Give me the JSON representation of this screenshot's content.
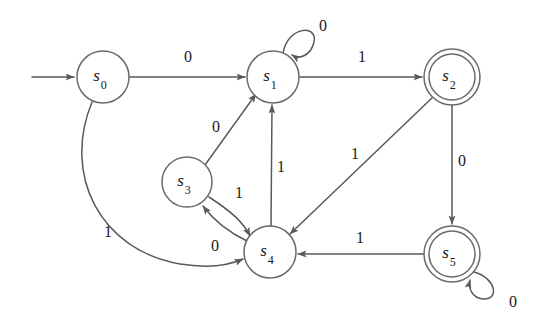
{
  "diagram": {
    "type": "state-machine",
    "background_color": "#ffffff",
    "stroke_color": "#595959",
    "node_stroke_color": "#6b6b6b",
    "text_color": "#1a1a1a",
    "alphabet": [
      "0",
      "1"
    ],
    "start_state": "s0",
    "accepting_states": [
      "s2",
      "s5"
    ]
  },
  "nodes": [
    {
      "id": "s0",
      "base": "s",
      "sub": "0",
      "cx": 103,
      "cy": 77,
      "r": 26,
      "accepting": false
    },
    {
      "id": "s1",
      "base": "s",
      "sub": "1",
      "cx": 273,
      "cy": 77,
      "r": 26,
      "accepting": false
    },
    {
      "id": "s2",
      "base": "s",
      "sub": "2",
      "cx": 452,
      "cy": 77,
      "r": 28,
      "accepting": true
    },
    {
      "id": "s3",
      "base": "s",
      "sub": "3",
      "cx": 187,
      "cy": 182,
      "r": 25,
      "accepting": false
    },
    {
      "id": "s4",
      "base": "s",
      "sub": "4",
      "cx": 270,
      "cy": 252,
      "r": 26,
      "accepting": false
    },
    {
      "id": "s5",
      "base": "s",
      "sub": "5",
      "cx": 452,
      "cy": 254,
      "r": 28,
      "accepting": true
    }
  ],
  "edges": [
    {
      "id": "start",
      "from": "",
      "to": "s0",
      "label": "",
      "label_x": 0,
      "label_y": 0,
      "kind": "start-arrow"
    },
    {
      "id": "s0-s1",
      "from": "s0",
      "to": "s1",
      "label": "0",
      "label_x": 188,
      "label_y": 58,
      "kind": "straight"
    },
    {
      "id": "s1-s1",
      "from": "s1",
      "to": "s1",
      "label": "0",
      "label_x": 323,
      "label_y": 27,
      "kind": "self-loop"
    },
    {
      "id": "s1-s2",
      "from": "s1",
      "to": "s2",
      "label": "1",
      "label_x": 362,
      "label_y": 58,
      "kind": "straight"
    },
    {
      "id": "s2-s5",
      "from": "s2",
      "to": "s5",
      "label": "0",
      "label_x": 462,
      "label_y": 162,
      "kind": "straight"
    },
    {
      "id": "s2-s4",
      "from": "s2",
      "to": "s4",
      "label": "1",
      "label_x": 355,
      "label_y": 155,
      "kind": "straight"
    },
    {
      "id": "s3-s1",
      "from": "s3",
      "to": "s1",
      "label": "0",
      "label_x": 216,
      "label_y": 128,
      "kind": "straight"
    },
    {
      "id": "s3-s4",
      "from": "s3",
      "to": "s4",
      "label": "1",
      "label_x": 239,
      "label_y": 194,
      "kind": "curve"
    },
    {
      "id": "s4-s3",
      "from": "s4",
      "to": "s3",
      "label": "0",
      "label_x": 215,
      "label_y": 247,
      "kind": "curve"
    },
    {
      "id": "s4-s1",
      "from": "s4",
      "to": "s1",
      "label": "1",
      "label_x": 281,
      "label_y": 168,
      "kind": "straight"
    },
    {
      "id": "s5-s5",
      "from": "s5",
      "to": "s5",
      "label": "0",
      "label_x": 513,
      "label_y": 303,
      "kind": "self-loop"
    },
    {
      "id": "s5-s4",
      "from": "s5",
      "to": "s4",
      "label": "1",
      "label_x": 360,
      "label_y": 239,
      "kind": "straight"
    },
    {
      "id": "s0-s4",
      "from": "s0",
      "to": "s4",
      "label": "1",
      "label_x": 108,
      "label_y": 233,
      "kind": "long-curve"
    }
  ],
  "transition_table": {
    "columns": [
      "state",
      "on 0",
      "on 1"
    ],
    "rows": [
      [
        "s0",
        "s1",
        "s4"
      ],
      [
        "s1",
        "s1",
        "s2"
      ],
      [
        "s2",
        "s5",
        "s4"
      ],
      [
        "s3",
        "s1",
        "s4"
      ],
      [
        "s4",
        "s3",
        "s1"
      ],
      [
        "s5",
        "s5",
        "s4"
      ]
    ]
  },
  "geometry": {
    "start_arrow_path": "M 32 77 L 74 77",
    "s0_s1_path": "M 129 77 L 245 77",
    "s1_self_loop_path": "M 283 53 C 288 26, 318 24, 314 42 C 311 55, 300 60, 292 55",
    "s1_s2_path": "M 299 77 L 422 77",
    "s2_s5_path": "M 452 105 L 452 224",
    "s2_s4_path": "M 433 97 L 290 234",
    "s3_s1_path": "M 205 165 L 256 94",
    "s3_s4_path": "M 209 197 C 232 212, 243 222, 250 236",
    "s4_s3_path": "M 247 241 C 228 232, 215 222, 203 206",
    "s4_s1_path": "M 271 226 L 272 105",
    "s5_self_loop_path": "M 474 272 C 496 278, 500 300, 483 299 C 472 298, 468 288, 470 280",
    "s5_s4_path": "M 424 254 L 298 254",
    "s0_s4_path": "M 92 102 C 62 175, 100 250, 180 264 C 212 269, 232 264, 243 259"
  }
}
